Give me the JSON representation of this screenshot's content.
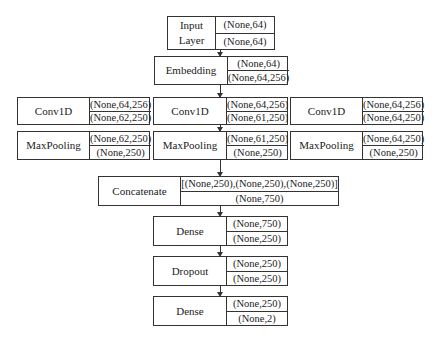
{
  "diagram": {
    "input_layer": {
      "name": "Input Layer",
      "name_lines": [
        "Input",
        "Layer"
      ],
      "input_shape": "(None,64)",
      "output_shape": "(None,64)"
    },
    "embedding": {
      "name": "Embedding",
      "input_shape": "(None,64)",
      "output_shape": "(None,64,256)"
    },
    "branches": [
      {
        "conv": {
          "name": "Conv1D",
          "input_shape": "(None,64,256)",
          "output_shape": "(None,62,250)"
        },
        "pool": {
          "name": "MaxPooling",
          "input_shape": "(None,62,250)",
          "output_shape": "(None,250)"
        }
      },
      {
        "conv": {
          "name": "Conv1D",
          "input_shape": "(None,64,256)",
          "output_shape": "(None,61,250)"
        },
        "pool": {
          "name": "MaxPooling",
          "input_shape": "(None,61,250)",
          "output_shape": "(None,250)"
        }
      },
      {
        "conv": {
          "name": "Conv1D",
          "input_shape": "(None,64,256)",
          "output_shape": "(None,64,250)"
        },
        "pool": {
          "name": "MaxPooling",
          "input_shape": "(None,64,250)",
          "output_shape": "(None,250)"
        }
      }
    ],
    "concatenate": {
      "name": "Concatenate",
      "input_shape": "[(None,250),(None,250),(None,250)]",
      "output_shape": "(None,750)"
    },
    "dense1": {
      "name": "Dense",
      "input_shape": "(None,750)",
      "output_shape": "(None,250)"
    },
    "dropout": {
      "name": "Dropout",
      "input_shape": "(None,250)",
      "output_shape": "(None,250)"
    },
    "dense2": {
      "name": "Dense",
      "input_shape": "(None,250)",
      "output_shape": "(None,2)"
    }
  }
}
